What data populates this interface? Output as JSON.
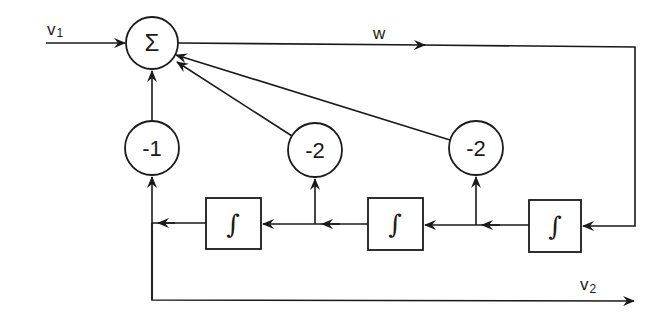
{
  "diagram": {
    "type": "block-diagram",
    "colors": {
      "stroke": "#1a1a1a",
      "background": "#ffffff"
    },
    "signals": {
      "input": {
        "label": "v",
        "subscript": "1"
      },
      "internal": {
        "label": "w"
      },
      "output": {
        "label": "v",
        "subscript": "2"
      }
    },
    "summing_junction": {
      "symbol": "Σ"
    },
    "gains": [
      {
        "id": "gain-left",
        "label": "-1"
      },
      {
        "id": "gain-middle",
        "label": "-2"
      },
      {
        "id": "gain-right",
        "label": "-2"
      }
    ],
    "integrators": [
      {
        "id": "integrator-right",
        "symbol": "∫"
      },
      {
        "id": "integrator-middle",
        "symbol": "∫"
      },
      {
        "id": "integrator-left",
        "symbol": "∫"
      }
    ],
    "connections": [
      "v1 -> Σ",
      "Σ -> w -> integrator-right",
      "integrator-right -> integrator-middle",
      "integrator-right output -> gain-right(-2) -> Σ",
      "integrator-middle -> integrator-left",
      "integrator-middle output -> gain-middle(-2) -> Σ",
      "integrator-left output -> gain-left(-1) -> Σ",
      "integrator-left output -> v2"
    ]
  }
}
